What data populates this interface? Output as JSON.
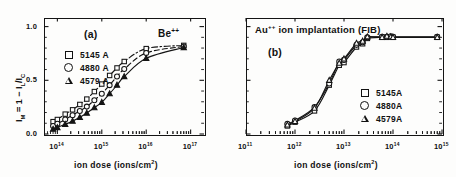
{
  "figure": {
    "x_axis_caption": "ion dose (ions/cm",
    "x_axis_caption_sup": "2",
    "x_axis_caption_tail": ")",
    "y_axis_label_prefix": "I",
    "y_axis_label_sub1": "M",
    "y_axis_label_mid": " = 1 − I",
    "y_axis_label_sub2": "L",
    "y_axis_label_slash": "/I",
    "y_axis_label_sub3": "C"
  },
  "panel_a": {
    "tag": "(a)",
    "species": "Be",
    "species_charge": "++",
    "y_ticks": [
      "1.0",
      "0.5",
      "0.0"
    ],
    "x_tick_mantissa": "10",
    "x_ticks_exp": [
      "14",
      "15",
      "16",
      "17"
    ],
    "legend": [
      {
        "marker": "square-marker",
        "label": "5145 A"
      },
      {
        "marker": "circle-marker",
        "label": "4880 A"
      },
      {
        "marker": "triangle-marker",
        "label": "4579 A"
      }
    ]
  },
  "panel_b": {
    "tag": "(b)",
    "title_species": "Au",
    "title_charge": "++",
    "title_rest": " ion implantation (FIB)",
    "x_tick_mantissa": "10",
    "x_ticks_exp": [
      "11",
      "12",
      "13",
      "14",
      "15"
    ],
    "legend": [
      {
        "marker": "square-marker",
        "label": "5145A"
      },
      {
        "marker": "circle-marker",
        "label": "4880A"
      },
      {
        "marker": "triangle-marker",
        "label": "4579A"
      }
    ]
  },
  "chart_data": [
    {
      "type": "scatter",
      "title": "(a) Be++ ion implantation",
      "xlabel": "ion dose (ions/cm2)",
      "ylabel": "IM = 1 - IL/IC",
      "xscale": "log",
      "xlim": [
        50000000000000.0,
        2e+17
      ],
      "ylim": [
        0.0,
        1.08
      ],
      "yticks": [
        0.0,
        0.5,
        1.0
      ],
      "xticks": [
        100000000000000.0,
        1000000000000000.0,
        1e+16,
        1e+17
      ],
      "grid": false,
      "legend_position": "upper-left",
      "series": [
        {
          "name": "5145 A",
          "marker": "square",
          "linestyle": "dash-dot",
          "x": [
            80000000000000.0,
            100000000000000.0,
            150000000000000.0,
            220000000000000.0,
            320000000000000.0,
            460000000000000.0,
            680000000000000.0,
            1000000000000000.0,
            1500000000000000.0,
            2200000000000000.0,
            3200000000000000.0,
            1e+16,
            7e+16
          ],
          "y": [
            0.115,
            0.135,
            0.185,
            0.225,
            0.275,
            0.325,
            0.395,
            0.465,
            0.545,
            0.615,
            0.675,
            0.795,
            0.825
          ]
        },
        {
          "name": "4880 A",
          "marker": "circle",
          "linestyle": "dashed",
          "x": [
            80000000000000.0,
            100000000000000.0,
            150000000000000.0,
            220000000000000.0,
            320000000000000.0,
            460000000000000.0,
            680000000000000.0,
            1000000000000000.0,
            1500000000000000.0,
            2200000000000000.0,
            3200000000000000.0,
            1e+16,
            7e+16
          ],
          "y": [
            0.075,
            0.095,
            0.135,
            0.175,
            0.215,
            0.255,
            0.315,
            0.375,
            0.455,
            0.535,
            0.605,
            0.755,
            0.815
          ]
        },
        {
          "name": "4579 A",
          "marker": "triangle",
          "linestyle": "solid",
          "x": [
            80000000000000.0,
            100000000000000.0,
            150000000000000.0,
            220000000000000.0,
            320000000000000.0,
            460000000000000.0,
            680000000000000.0,
            1000000000000000.0,
            1500000000000000.0,
            2200000000000000.0,
            3200000000000000.0,
            1e+16,
            7e+16
          ],
          "y": [
            0.045,
            0.06,
            0.09,
            0.12,
            0.155,
            0.195,
            0.245,
            0.295,
            0.375,
            0.455,
            0.535,
            0.705,
            0.805
          ]
        }
      ]
    },
    {
      "type": "scatter",
      "title": "Au++ ion implantation (FIB)",
      "xlabel": "ion dose (ions/cm2)",
      "ylabel": "IM = 1 - IL/IC",
      "xscale": "log",
      "xlim": [
        100000000000.0,
        1000000000000000.0
      ],
      "ylim": [
        0.0,
        1.08
      ],
      "yticks": [
        0.0,
        0.5,
        1.0
      ],
      "xticks": [
        100000000000.0,
        1000000000000.0,
        10000000000000.0,
        100000000000000.0,
        1000000000000000.0
      ],
      "grid": false,
      "legend_position": "lower-right",
      "series": [
        {
          "name": "5145A",
          "marker": "square",
          "linestyle": "solid",
          "x": [
            700000000000.0,
            1000000000000.0,
            2500000000000.0,
            5000000000000.0,
            8000000000000.0,
            10000000000000.0,
            18000000000000.0,
            24000000000000.0,
            30000000000000.0,
            60000000000000.0,
            75000000000000.0,
            90000000000000.0,
            100000000000000.0,
            800000000000000.0
          ],
          "y": [
            0.075,
            0.11,
            0.215,
            0.455,
            0.64,
            0.665,
            0.81,
            0.84,
            0.89,
            0.9,
            0.9,
            0.905,
            0.9,
            0.9
          ]
        },
        {
          "name": "4880A",
          "marker": "circle",
          "linestyle": "solid",
          "x": [
            700000000000.0,
            1000000000000.0,
            2500000000000.0,
            5000000000000.0,
            8000000000000.0,
            10000000000000.0,
            18000000000000.0,
            24000000000000.0,
            30000000000000.0,
            60000000000000.0,
            75000000000000.0,
            90000000000000.0,
            100000000000000.0,
            800000000000000.0
          ],
          "y": [
            0.095,
            0.125,
            0.25,
            0.47,
            0.675,
            0.69,
            0.83,
            0.855,
            0.9,
            0.905,
            0.905,
            0.91,
            0.905,
            0.905
          ]
        },
        {
          "name": "4579A",
          "marker": "triangle",
          "linestyle": "solid",
          "x": [
            700000000000.0,
            1000000000000.0,
            2500000000000.0,
            5000000000000.0,
            8000000000000.0,
            10000000000000.0,
            18000000000000.0,
            24000000000000.0,
            30000000000000.0,
            60000000000000.0,
            75000000000000.0,
            90000000000000.0,
            100000000000000.0,
            800000000000000.0
          ],
          "y": [
            0.085,
            0.118,
            0.24,
            0.5,
            0.66,
            0.7,
            0.845,
            0.865,
            0.905,
            0.9,
            0.91,
            0.905,
            0.9,
            0.9
          ]
        }
      ]
    }
  ]
}
